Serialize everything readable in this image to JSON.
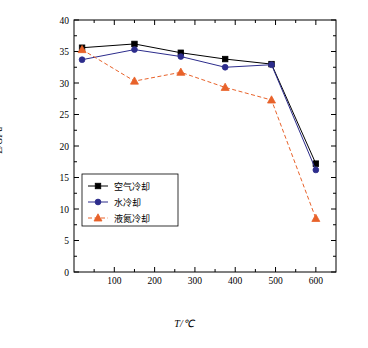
{
  "chart_data": {
    "type": "line",
    "title": "",
    "xlabel": "T/℃",
    "ylabel": "E/GPa",
    "xlim": [
      0,
      650
    ],
    "ylim": [
      0,
      40
    ],
    "xticks": [
      100,
      200,
      300,
      400,
      500,
      600
    ],
    "yticks": [
      0,
      5,
      10,
      15,
      20,
      25,
      30,
      35,
      40
    ],
    "grid": false,
    "legend_position": "lower-left",
    "x": [
      20,
      150,
      265,
      375,
      490,
      600
    ],
    "series": [
      {
        "name": "空气冷却",
        "color": "#000000",
        "marker": "square",
        "values": [
          35.6,
          36.2,
          34.8,
          33.8,
          33.0,
          17.2
        ]
      },
      {
        "name": "水冷却",
        "color": "#2c2c8c",
        "marker": "circle",
        "values": [
          33.7,
          35.3,
          34.2,
          32.5,
          32.9,
          16.2
        ]
      },
      {
        "name": "液氮冷却",
        "color": "#e8622a",
        "marker": "triangle",
        "values": [
          35.3,
          30.3,
          31.7,
          29.3,
          27.3,
          8.5
        ]
      }
    ]
  },
  "axis": {
    "x_label": "T/℃",
    "y_label": "E/GPa",
    "x_tick_labels": [
      "100",
      "200",
      "300",
      "400",
      "500",
      "600"
    ],
    "y_tick_labels": [
      "0",
      "5",
      "10",
      "15",
      "20",
      "25",
      "30",
      "35",
      "40"
    ]
  },
  "legend": {
    "items": [
      {
        "label": "空气冷却",
        "color": "#000000",
        "marker": "square"
      },
      {
        "label": "水冷却",
        "color": "#2c2c8c",
        "marker": "circle"
      },
      {
        "label": "液氮冷却",
        "color": "#e8622a",
        "marker": "triangle"
      }
    ]
  }
}
